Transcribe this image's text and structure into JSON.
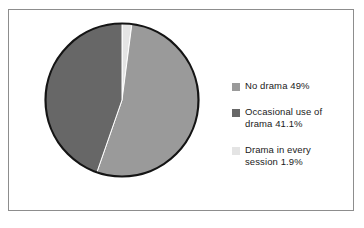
{
  "chart_data": {
    "type": "pie",
    "title": "",
    "subtitle": "",
    "xlabel": "",
    "ylabel": "",
    "legend_position": "right",
    "grid": false,
    "start_angle_deg": 0,
    "direction": "clockwise",
    "categories": [
      "No drama",
      "Occasional use of drama",
      "Drama in every session"
    ],
    "values": [
      49,
      41.1,
      1.9
    ],
    "value_unit": "%",
    "slices": [
      {
        "label": "No drama",
        "value": 49,
        "display": "No drama 49%",
        "color": "#9a9a9a"
      },
      {
        "label": "Occasional use of drama",
        "value": 41.1,
        "display": "Occasional use of\ndrama 41.1%",
        "color": "#676767"
      },
      {
        "label": "Drama in every session",
        "value": 1.9,
        "display": "Drama in every\nsession 1.9%",
        "color": "#e4e4e4"
      }
    ]
  },
  "legend": {
    "items": [
      {
        "text": "No drama 49%",
        "swatch_name": "legend-swatch-no-drama",
        "color": "#9a9a9a"
      },
      {
        "text": "Occasional use of\ndrama 41.1%",
        "swatch_name": "legend-swatch-occasional-drama",
        "color": "#676767"
      },
      {
        "text": "Drama in every\nsession 1.9%",
        "swatch_name": "legend-swatch-every-session",
        "color": "#e4e4e4"
      }
    ]
  },
  "style": {
    "background": "#ffffff",
    "frame_border": "#8d8d8d",
    "pie_outline": "#141414",
    "slice_divider": "#ffffff",
    "text_color": "#1a1a1a"
  }
}
